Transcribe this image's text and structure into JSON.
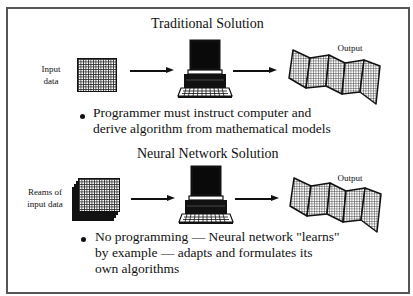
{
  "diagram": {
    "sections": [
      {
        "title": "Traditional Solution",
        "input_label": [
          "Input",
          "data"
        ],
        "output_label": "Output",
        "bullet": [
          "Programmer must instruct computer and",
          "derive algorithm from mathematical models"
        ]
      },
      {
        "title": "Neural Network Solution",
        "input_label": [
          "Reams of",
          "input data"
        ],
        "output_label": "Output",
        "bullet": [
          "No programming —  Neural network \"learns\"",
          "by example — adapts and formulates its",
          "own algorithms"
        ]
      }
    ],
    "icons": {
      "input_single": "grid-data-page-icon",
      "input_stack": "stacked-data-pages-icon",
      "processor": "computer-icon",
      "output": "fanfold-printout-icon",
      "flow": "arrow-right-icon"
    },
    "colors": {
      "border": "#555555",
      "ink": "#111111",
      "background": "#ffffff"
    }
  }
}
